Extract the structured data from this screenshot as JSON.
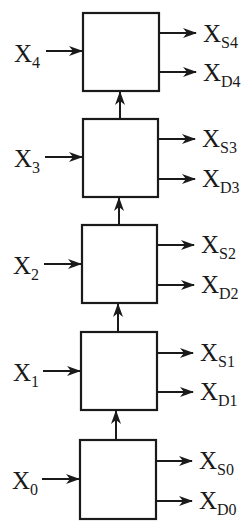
{
  "diagram": {
    "type": "cascaded-stages",
    "stroke_color": "#1a1a1a",
    "background": "#ffffff",
    "flow_direction": "bottom-to-top",
    "stages": [
      {
        "index": 4,
        "input": {
          "base": "X",
          "sub": "4"
        },
        "output_s": {
          "base": "X",
          "sub": "S4"
        },
        "output_d": {
          "base": "X",
          "sub": "D4"
        }
      },
      {
        "index": 3,
        "input": {
          "base": "X",
          "sub": "3"
        },
        "output_s": {
          "base": "X",
          "sub": "S3"
        },
        "output_d": {
          "base": "X",
          "sub": "D3"
        }
      },
      {
        "index": 2,
        "input": {
          "base": "X",
          "sub": "2"
        },
        "output_s": {
          "base": "X",
          "sub": "S2"
        },
        "output_d": {
          "base": "X",
          "sub": "D2"
        }
      },
      {
        "index": 1,
        "input": {
          "base": "X",
          "sub": "1"
        },
        "output_s": {
          "base": "X",
          "sub": "S1"
        },
        "output_d": {
          "base": "X",
          "sub": "D1"
        }
      },
      {
        "index": 0,
        "input": {
          "base": "X",
          "sub": "0"
        },
        "output_s": {
          "base": "X",
          "sub": "S0"
        },
        "output_d": {
          "base": "X",
          "sub": "D0"
        }
      }
    ]
  }
}
